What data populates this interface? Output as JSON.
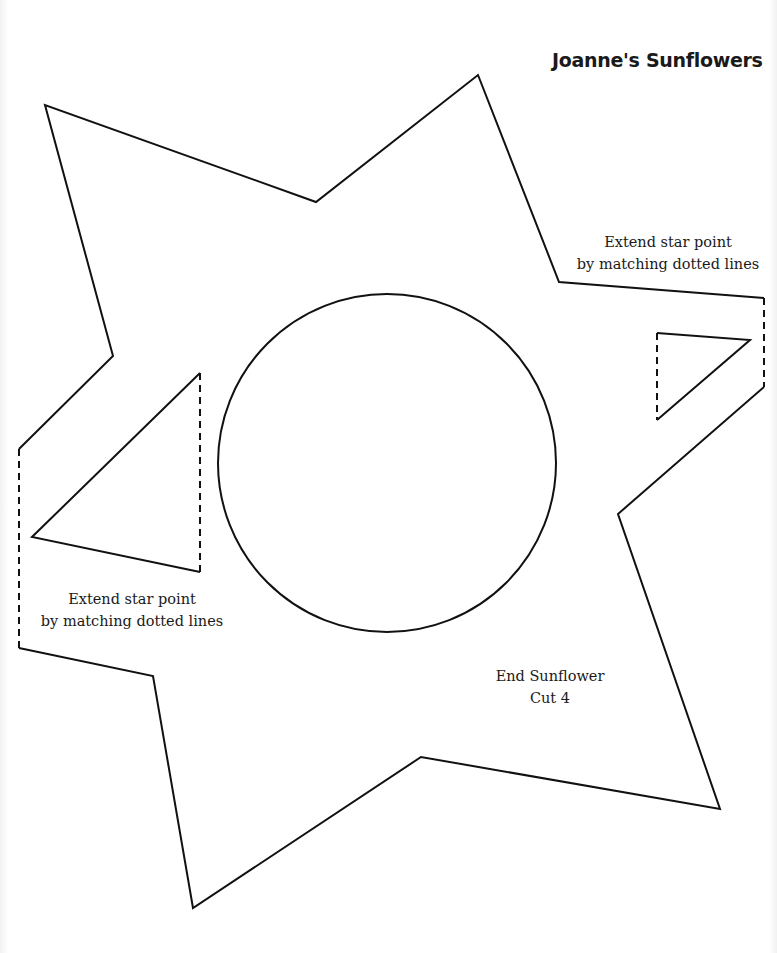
{
  "page": {
    "title": "Joanne's Sunflowers",
    "instruction_right": {
      "line1": "Extend star point",
      "line2": "by matching dotted lines"
    },
    "instruction_left": {
      "line1": "Extend star point",
      "line2": "by matching dotted lines"
    },
    "piece_label": {
      "name": "End Sunflower",
      "quantity": "Cut 4"
    }
  },
  "pattern": {
    "stroke_color": "#111111",
    "outline_shape": "star-icon",
    "center_shape": "circle-icon",
    "center_circle": {
      "cx": 387,
      "cy": 463,
      "r": 169
    }
  }
}
